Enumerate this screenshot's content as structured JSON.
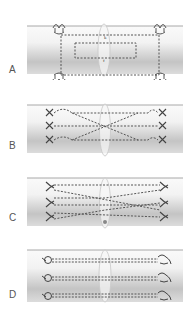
{
  "figure": {
    "panels": [
      {
        "label": "A",
        "technique": "box-sutures",
        "annotations": [
          "k",
          "f"
        ]
      },
      {
        "label": "B",
        "technique": "crossing-sutures-x"
      },
      {
        "label": "C",
        "technique": "crossing-sutures-x-alt"
      },
      {
        "label": "D",
        "technique": "parallel-knotted-sutures"
      }
    ]
  },
  "colors": {
    "tube_light": "#f4f4f4",
    "tube_dark": "#bdbdbd",
    "tube_edge": "#a8a8a8",
    "suture": "#555555",
    "ellipse": "#c8c8c8"
  }
}
